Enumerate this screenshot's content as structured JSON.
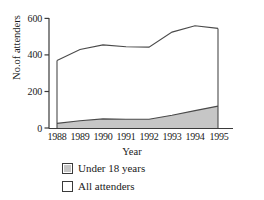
{
  "chart_data": {
    "type": "area",
    "title": "",
    "xlabel": "Year",
    "ylabel": "No.of attenders",
    "categories": [
      "1988",
      "1989",
      "1990",
      "1991",
      "1992",
      "1993",
      "1994",
      "1995"
    ],
    "x": [
      1988,
      1989,
      1990,
      1991,
      1992,
      1993,
      1994,
      1995
    ],
    "series": [
      {
        "name": "Under 18 years",
        "color": "#c6c6c6",
        "values": [
          25,
          40,
          50,
          48,
          48,
          70,
          95,
          120
        ]
      },
      {
        "name": "All attenders",
        "color": "#ffffff",
        "values": [
          370,
          430,
          455,
          445,
          443,
          525,
          560,
          545
        ]
      }
    ],
    "ylim": [
      0,
      600
    ],
    "yticks": [
      0,
      200,
      400,
      600
    ],
    "ytick_labels": [
      "0",
      "200",
      "400",
      "600"
    ],
    "xtick_labels": [
      "1988",
      "1989",
      "1990",
      "1991",
      "1992",
      "1993",
      "1994",
      "1995"
    ],
    "grid": false,
    "legend_position": "below-axes",
    "legend": [
      {
        "label": "Under 18 years",
        "swatch": "#c6c6c6"
      },
      {
        "label": "All attenders",
        "swatch": "#ffffff"
      }
    ],
    "axis_color": "#3a3a3a",
    "line_color": "#4a4a4a"
  }
}
